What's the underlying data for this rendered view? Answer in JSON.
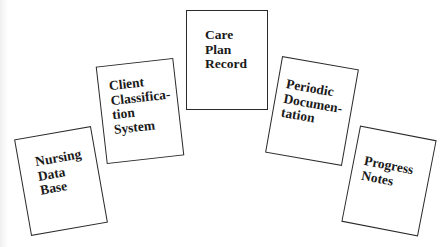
{
  "diagram": {
    "cards": [
      {
        "id": "nursing-data-base",
        "label": "Nursing\nData\nBase",
        "rotation_deg": -10
      },
      {
        "id": "client-classification-system",
        "label": "Client\nClassifica-\ntion\nSystem",
        "rotation_deg": -6.5
      },
      {
        "id": "care-plan-record",
        "label": "Care\nPlan\nRecord",
        "rotation_deg": 0
      },
      {
        "id": "periodic-documentation",
        "label": "Periodic\nDocumen-\ntation",
        "rotation_deg": 10
      },
      {
        "id": "progress-notes",
        "label": "Progress\nNotes",
        "rotation_deg": 11
      }
    ],
    "colors": {
      "border": "#2a2a2a",
      "text": "#1a1a1a",
      "background": "#ffffff"
    }
  }
}
